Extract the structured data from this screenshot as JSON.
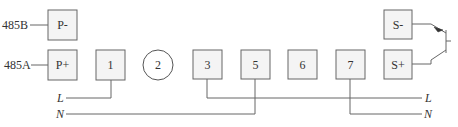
{
  "diagram": {
    "type": "wiring-diagram",
    "bus_labels": {
      "rs485_b": "485B",
      "rs485_a": "485A"
    },
    "terminals": [
      {
        "id": "p_minus",
        "label": "P-",
        "shape": "box"
      },
      {
        "id": "p_plus",
        "label": "P+",
        "shape": "box"
      },
      {
        "id": "t1",
        "label": "1",
        "shape": "box"
      },
      {
        "id": "t2",
        "label": "2",
        "shape": "circle"
      },
      {
        "id": "t3",
        "label": "3",
        "shape": "box"
      },
      {
        "id": "t5",
        "label": "5",
        "shape": "box"
      },
      {
        "id": "t6",
        "label": "6",
        "shape": "box"
      },
      {
        "id": "t7",
        "label": "7",
        "shape": "box"
      },
      {
        "id": "s_minus",
        "label": "S-",
        "shape": "box"
      },
      {
        "id": "s_plus",
        "label": "S+",
        "shape": "box"
      }
    ],
    "lines": {
      "left_l": "L",
      "left_n": "N",
      "right_l": "L",
      "right_n": "N"
    },
    "connections": [
      {
        "from": "485B",
        "to": "P-"
      },
      {
        "from": "485A",
        "to": "P+"
      },
      {
        "from": "1",
        "to": "L (left)"
      },
      {
        "from": "5",
        "to": "N (left)"
      },
      {
        "from": "3",
        "to": "L (right)"
      },
      {
        "from": "7",
        "to": "N (right)"
      },
      {
        "from": "S-",
        "to": "transistor emitter"
      },
      {
        "from": "S+",
        "to": "transistor collector"
      }
    ],
    "colors": {
      "line": "#666666",
      "box_fill": "#f4f4f4",
      "text": "#333333"
    }
  }
}
